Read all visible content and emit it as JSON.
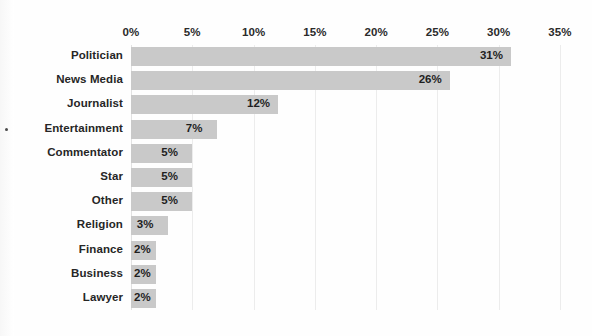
{
  "chart_data": {
    "type": "bar",
    "orientation": "horizontal",
    "title": "",
    "subtitle": "",
    "xlabel": "",
    "ylabel": "",
    "categories": [
      "Politician",
      "News Media",
      "Journalist",
      "Entertainment",
      "Commentator",
      "Star",
      "Other",
      "Religion",
      "Finance",
      "Business",
      "Lawyer"
    ],
    "values": [
      31,
      26,
      12,
      7,
      5,
      5,
      5,
      3,
      2,
      2,
      2
    ],
    "value_labels": [
      "31%",
      "26%",
      "12%",
      "7%",
      "5%",
      "5%",
      "5%",
      "3%",
      "2%",
      "2%",
      "2%"
    ],
    "xlim": [
      0,
      35
    ],
    "xticks": [
      0,
      5,
      10,
      15,
      20,
      25,
      30,
      35
    ],
    "xtick_labels": [
      "0%",
      "5%",
      "10%",
      "15%",
      "20%",
      "25%",
      "30%",
      "35%"
    ],
    "grid": true,
    "grid_axis": "x",
    "legend": false,
    "axis_position": "top",
    "colors": {
      "bar": "#c9c9c9",
      "gridline": "#ececec",
      "label_text": "#262626",
      "tick_text": "#2b2b2b",
      "background": "#ffffff"
    }
  }
}
